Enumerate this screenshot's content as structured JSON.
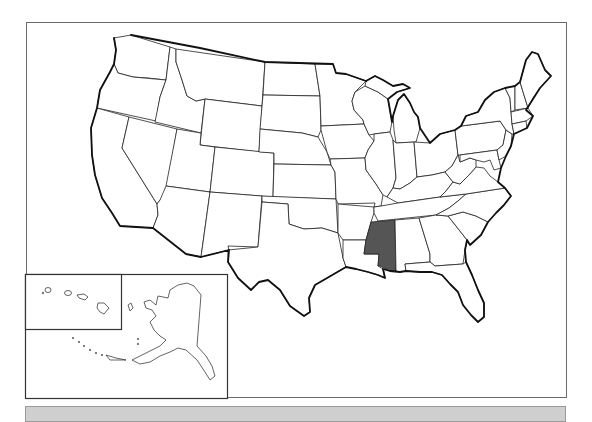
{
  "map": {
    "title": "",
    "type": "US states outline map",
    "highlighted_state": "Mississippi",
    "highlight_color": "#555555",
    "outline_color": "#222222",
    "background_color": "#ffffff",
    "insets": [
      {
        "name": "Hawaii"
      },
      {
        "name": "Alaska"
      }
    ]
  },
  "answer_bar": {
    "value": "",
    "background_color": "#cfcfcf"
  }
}
